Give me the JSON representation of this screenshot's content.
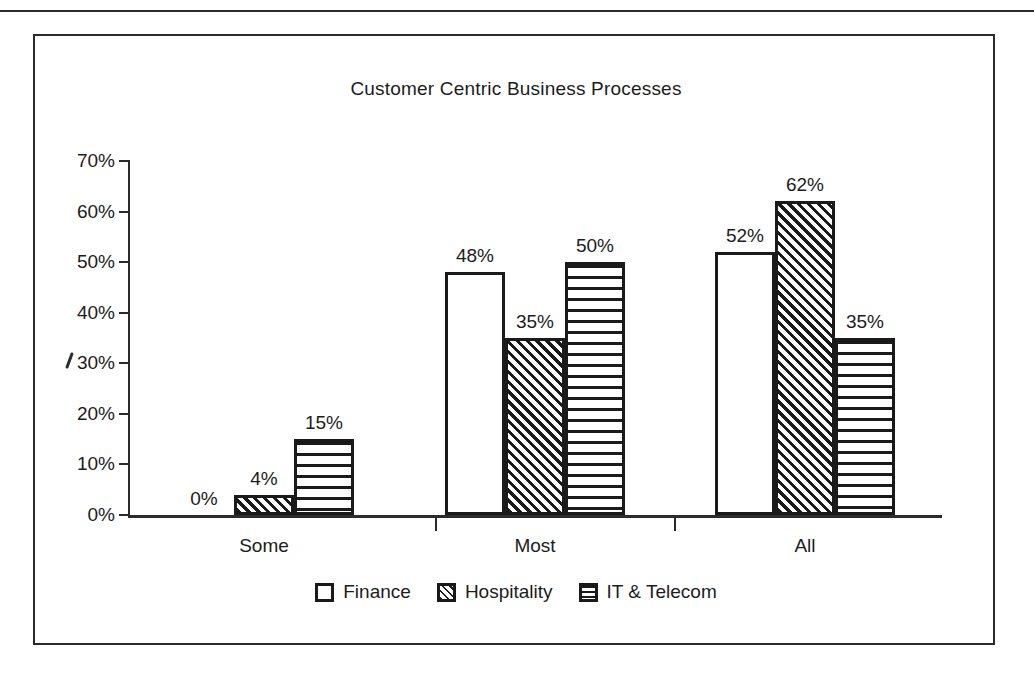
{
  "chart_data": {
    "type": "bar",
    "title": "Customer Centric Business Processes",
    "xlabel": "",
    "ylabel": "",
    "categories": [
      "Some",
      "Most",
      "All"
    ],
    "series": [
      {
        "name": "Finance",
        "values": [
          0,
          48,
          52
        ],
        "pattern": "plain"
      },
      {
        "name": "Hospitality",
        "values": [
          4,
          35,
          62
        ],
        "pattern": "diagonal-hatch"
      },
      {
        "name": "IT & Telecom",
        "values": [
          15,
          50,
          35
        ],
        "pattern": "horizontal-stripes"
      }
    ],
    "data_labels": [
      [
        "0%",
        "4%",
        "15%"
      ],
      [
        "48%",
        "35%",
        "50%"
      ],
      [
        "52%",
        "62%",
        "35%"
      ]
    ],
    "ylim": [
      0,
      70
    ],
    "ytick_values": [
      0,
      10,
      20,
      30,
      40,
      50,
      60,
      70
    ],
    "ytick_labels": [
      "0%",
      "10%",
      "20%",
      "30%",
      "40%",
      "50%",
      "60%",
      "70%"
    ],
    "grid": false,
    "legend_position": "bottom-center",
    "value_unit": "%",
    "colors": {
      "ink": "#1a1a1a",
      "background": "#ffffff"
    }
  },
  "legend": {
    "items": [
      {
        "label": "Finance",
        "swatch": "plain-square-icon"
      },
      {
        "label": "Hospitality",
        "swatch": "diagonal-hatch-square-icon"
      },
      {
        "label": "IT & Telecom",
        "swatch": "horizontal-stripe-square-icon"
      }
    ]
  }
}
